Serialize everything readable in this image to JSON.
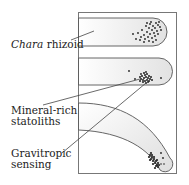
{
  "labels": {
    "chara_italic": "Chara",
    "rhizoid": " rhizoid",
    "statoliths_line1": "Mineral-rich",
    "statoliths_line2": "statoliths",
    "sensing_line1": "Gravitropic",
    "sensing_line2": "sensing"
  },
  "colors": {
    "outline": "#555555",
    "cell_fill": "#ececec",
    "statolith": "#222222",
    "frame": "#777777"
  },
  "panels": [
    {
      "name": "horizontal-rhizoid-initial",
      "orientation": "horizontal",
      "statolith_position": "dispersed near tip"
    },
    {
      "name": "horizontal-rhizoid-settled",
      "orientation": "horizontal",
      "statolith_position": "settled on lower side"
    },
    {
      "name": "rhizoid-bending-down",
      "orientation": "curved downward",
      "statolith_position": "clustered at tip"
    }
  ]
}
